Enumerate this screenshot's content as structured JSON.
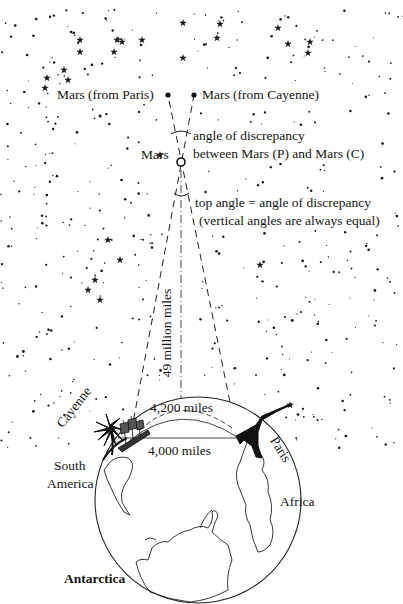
{
  "labels": {
    "mars_from_paris": "Mars (from Paris)",
    "mars_from_cayenne": "Mars (from Cayenne)",
    "angle_line1": "angle of discrepancy",
    "angle_line2": "between Mars (P) and Mars (C)",
    "mars": "Mars",
    "top_angle_line1": "top angle = angle of discrepancy",
    "top_angle_line2": "(vertical angles are always equal)",
    "distance_earth_mars": "49 million miles",
    "arc_distance": "4,200 miles",
    "chord_distance": "4,000 miles",
    "cayenne": "Cayenne",
    "paris": "Paris",
    "south_america_line1": "South",
    "south_america_line2": "America",
    "africa": "Africa",
    "antarctica": "Antarctica"
  },
  "colors": {
    "ink": "#151515",
    "background": "#ffffff"
  }
}
